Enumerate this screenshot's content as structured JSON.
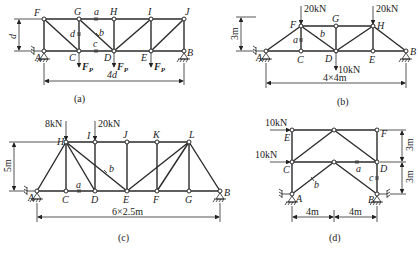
{
  "diagrams": [
    {
      "id": "a",
      "caption": "(a)",
      "dimension_height": "d",
      "dimension_span": "4d",
      "nodes": {
        "F": "F",
        "G": "G",
        "H": "H",
        "I": "I",
        "J": "J",
        "A": "A",
        "C": "C",
        "D": "D",
        "E": "E",
        "B": "B"
      },
      "member_labels": {
        "a": "a",
        "b": "b",
        "c": "c",
        "d": "d"
      },
      "loads": [
        {
          "at": "C",
          "label": "F",
          "sub": "P"
        },
        {
          "at": "D",
          "label": "F",
          "sub": "P"
        },
        {
          "at": "E",
          "label": "F",
          "sub": "P"
        }
      ]
    },
    {
      "id": "b",
      "caption": "(b)",
      "dimension_height": "3m",
      "dimension_span": "4×4m",
      "nodes": {
        "F": "F",
        "G": "G",
        "H": "H",
        "A": "A",
        "C": "C",
        "D": "D",
        "E": "E",
        "B": "B"
      },
      "member_labels": {
        "a": "a",
        "b": "b"
      },
      "loads": [
        {
          "at": "F",
          "label": "20kN"
        },
        {
          "at": "H",
          "label": "20kN"
        },
        {
          "at": "D",
          "label": "10kN"
        }
      ]
    },
    {
      "id": "c",
      "caption": "(c)",
      "dimension_height": "5m",
      "dimension_span": "6×2.5m",
      "nodes": {
        "H": "H",
        "I": "I",
        "J": "J",
        "K": "K",
        "L": "L",
        "A": "A",
        "C": "C",
        "D": "D",
        "E": "E",
        "F": "F",
        "G": "G",
        "B": "B"
      },
      "member_labels": {
        "a": "a",
        "b": "b"
      },
      "loads": [
        {
          "at": "H",
          "label": "8kN"
        },
        {
          "at": "I",
          "label": "20kN"
        }
      ]
    },
    {
      "id": "d",
      "caption": "(d)",
      "dimension_height_upper": "3m",
      "dimension_height_lower": "3m",
      "dimension_span_left": "4m",
      "dimension_span_right": "4m",
      "nodes": {
        "E": "E",
        "F": "F",
        "C": "C",
        "D": "D",
        "A": "A",
        "B": "B"
      },
      "member_labels": {
        "a": "a",
        "b": "b",
        "c": "c"
      },
      "loads": [
        {
          "at": "E",
          "label": "10kN"
        },
        {
          "at": "C",
          "label": "10kN"
        }
      ]
    }
  ]
}
